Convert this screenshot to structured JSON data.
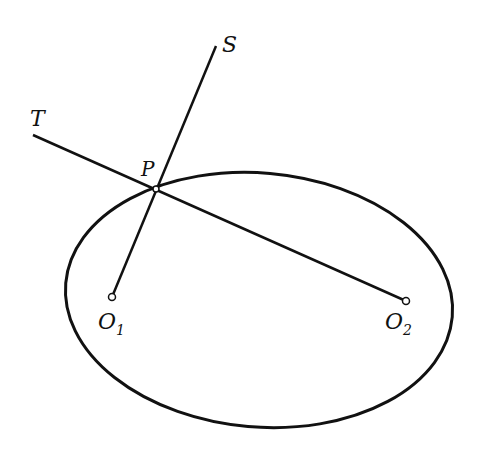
{
  "diagram": {
    "type": "ellipse-reflection-geometry",
    "stroke_color": "#111111",
    "background": "#ffffff",
    "ellipse": {
      "cx": 259,
      "cy": 300,
      "rx": 194,
      "ry": 127,
      "rotation": 5
    },
    "points": {
      "P": {
        "label": "P",
        "x": 156,
        "y": 189
      },
      "O1": {
        "label": "O",
        "subscript": "1",
        "x": 112,
        "y": 297
      },
      "O2": {
        "label": "O",
        "subscript": "2",
        "x": 406,
        "y": 301
      },
      "T": {
        "label": "T",
        "x": 33,
        "y": 135
      },
      "S": {
        "label": "S",
        "x": 216,
        "y": 46
      }
    },
    "lines": [
      {
        "name": "line-T-O2",
        "from": "T",
        "to": "O2"
      },
      {
        "name": "line-S-O1",
        "from": "S",
        "to": "O1"
      }
    ]
  }
}
